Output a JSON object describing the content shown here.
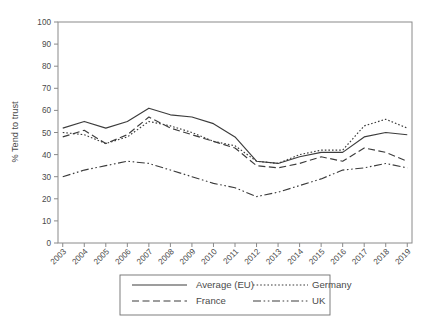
{
  "figure": {
    "clipped_caption": "",
    "axis": {
      "ylabel": "% Tend to trust",
      "yticks": [
        "0",
        "10",
        "20",
        "30",
        "40",
        "50",
        "60",
        "70",
        "80",
        "90",
        "100"
      ],
      "xticks": [
        "2003",
        "2004",
        "2005",
        "2006",
        "2007",
        "2008",
        "2009",
        "2010",
        "2011",
        "2012",
        "2013",
        "2014",
        "2015",
        "2016",
        "2017",
        "2018",
        "2019"
      ]
    },
    "legend": {
      "entries": [
        {
          "label": "Average (EU)",
          "style": "solid"
        },
        {
          "label": "Germany",
          "style": "dotted"
        },
        {
          "label": "France",
          "style": "dashed"
        },
        {
          "label": "UK",
          "style": "dashdotdot"
        }
      ]
    }
  },
  "chart_data": {
    "type": "line",
    "title": "",
    "xlabel": "",
    "ylabel": "% Tend to trust",
    "xlim": [
      2003,
      2019
    ],
    "ylim": [
      0,
      100
    ],
    "ytick_step": 10,
    "grid": false,
    "legend_position": "bottom",
    "x": [
      2003,
      2004,
      2005,
      2006,
      2007,
      2008,
      2009,
      2010,
      2011,
      2012,
      2013,
      2014,
      2015,
      2016,
      2017,
      2018,
      2019
    ],
    "series": [
      {
        "name": "Average (EU)",
        "style": "solid",
        "values": [
          52,
          55,
          52,
          55,
          61,
          58,
          57,
          54,
          48,
          37,
          36,
          39,
          41,
          41,
          48,
          50,
          49
        ]
      },
      {
        "name": "Germany",
        "style": "dotted",
        "values": [
          50,
          49,
          45,
          48,
          55,
          53,
          50,
          46,
          44,
          37,
          36,
          40,
          42,
          42,
          53,
          56,
          52
        ]
      },
      {
        "name": "France",
        "style": "dashed",
        "values": [
          48,
          51,
          45,
          49,
          57,
          52,
          49,
          46,
          43,
          35,
          34,
          36,
          39,
          37,
          43,
          41,
          37
        ]
      },
      {
        "name": "UK",
        "style": "dashdotdot",
        "values": [
          30,
          33,
          35,
          37,
          36,
          33,
          30,
          27,
          25,
          21,
          23,
          26,
          29,
          33,
          34,
          36,
          34
        ]
      }
    ]
  }
}
